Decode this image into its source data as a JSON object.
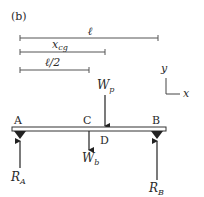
{
  "figure": {
    "panel_label": "(b)",
    "dimensions": [
      {
        "id": "length",
        "label": "ℓ",
        "x1": 20,
        "x2": 158,
        "y": 38
      },
      {
        "id": "xcg",
        "label_main": "x",
        "label_sub": "cg",
        "x1": 20,
        "x2": 105,
        "y": 52
      },
      {
        "id": "half_length",
        "label": "ℓ/2",
        "x1": 20,
        "x2": 89,
        "y": 70
      }
    ],
    "beam": {
      "x1": 12,
      "x2": 166,
      "y": 127,
      "height": 4
    },
    "points": {
      "A": "A",
      "B": "B",
      "C": "C",
      "D": "D"
    },
    "forces": {
      "Wp": {
        "main": "W",
        "sub": "p"
      },
      "Wb": {
        "main": "W",
        "sub": "b"
      },
      "RA": {
        "main": "R",
        "sub": "A"
      },
      "RB": {
        "main": "R",
        "sub": "B"
      }
    },
    "axes": {
      "y_label": "y",
      "x_label": "x"
    },
    "colors": {
      "line": "#333333",
      "dim_line": "#555555",
      "beam_fill": "#ffffff"
    }
  }
}
